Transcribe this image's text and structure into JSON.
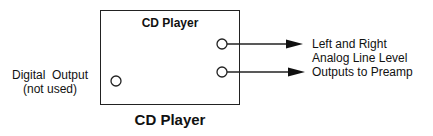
{
  "diagram": {
    "box_title": "CD Player",
    "caption": "CD Player",
    "left_label": {
      "line1": "Digital  Output",
      "line2": "(not used)"
    },
    "right_label": {
      "line1": "Left and Right",
      "line2": "Analog Line Level",
      "line3": "Outputs to Preamp"
    },
    "jacks": [
      {
        "name": "left-analog-output",
        "x": 222,
        "y": 44
      },
      {
        "name": "right-analog-output",
        "x": 222,
        "y": 72
      },
      {
        "name": "digital-output",
        "x": 116,
        "y": 81
      }
    ],
    "colors": {
      "stroke": "#222222",
      "background": "#ffffff"
    }
  }
}
